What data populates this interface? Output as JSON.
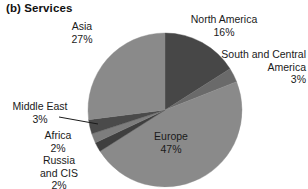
{
  "chart": {
    "title": "(b) Services"
  },
  "chart_data": {
    "type": "pie",
    "title": "(b) Services",
    "xlabel": "",
    "ylabel": "",
    "legend_position": "none",
    "grid": false,
    "value_unit": "%",
    "categories": [
      "North America",
      "South and Central America",
      "Europe",
      "Russia and CIS",
      "Africa",
      "Middle East",
      "Asia"
    ],
    "values": [
      16,
      3,
      47,
      2,
      2,
      3,
      27
    ],
    "labels": [
      {
        "name": "North America",
        "value": 16,
        "value_text": "16%",
        "color": "#474747"
      },
      {
        "name": "South and Central America",
        "value": 3,
        "value_text": "3%",
        "color": "#6a6a6a"
      },
      {
        "name": "Europe",
        "value": 47,
        "value_text": "47%",
        "color": "#8a8a8a"
      },
      {
        "name": "Russia and CIS",
        "value": 2,
        "value_text": "2%",
        "color": "#3f3f3f"
      },
      {
        "name": "Africa",
        "value": 2,
        "value_text": "2%",
        "color": "#7d7d7d"
      },
      {
        "name": "Middle East",
        "value": 3,
        "value_text": "3%",
        "color": "#4a4a4a"
      },
      {
        "name": "Asia",
        "value": 27,
        "value_text": "27%",
        "color": "#8a8a8a"
      }
    ],
    "annotations": [
      {
        "name": "middle-east-leader",
        "text": "",
        "from": "label",
        "to": "slice"
      }
    ],
    "start_angle_deg": 0,
    "direction": "clockwise"
  },
  "labels": {
    "asia": {
      "name": "Asia",
      "pct": "27%"
    },
    "north_america": {
      "name": "North America",
      "pct": "16%"
    },
    "south_central_1": {
      "name": "South and Central",
      "name2": "America",
      "pct": "3%"
    },
    "europe": {
      "name": "Europe",
      "pct": "47%"
    },
    "middle_east": {
      "name": "Middle East",
      "pct": "3%"
    },
    "africa": {
      "name": "Africa",
      "pct": "2%"
    },
    "russia": {
      "name": "Russia",
      "name2": "and CIS",
      "pct": "2%"
    }
  }
}
